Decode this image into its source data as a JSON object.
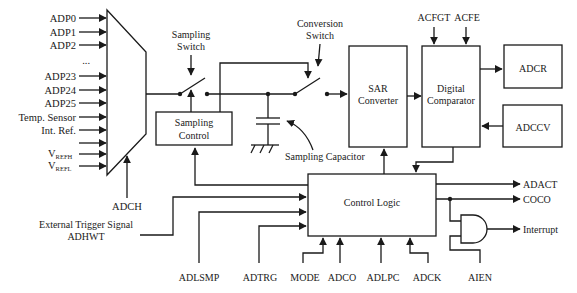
{
  "diagram": {
    "mux": {
      "inputs": [
        "ADP0",
        "ADP1",
        "ADP2",
        "...",
        "ADP23",
        "ADP24",
        "ADP25",
        "Temp. Sensor",
        "Int. Ref.",
        "",
        "V",
        "V"
      ],
      "vrefh_main": "V",
      "vrefh_sub": "REFH",
      "vrefl_main": "V",
      "vrefl_sub": "REFL",
      "select_label": "ADCH"
    },
    "sampling_switch_label_1": "Sampling",
    "sampling_switch_label_2": "Switch",
    "conversion_switch_label_1": "Conversion",
    "conversion_switch_label_2": "Switch",
    "sampling_control_1": "Sampling",
    "sampling_control_2": "Control",
    "sampling_capacitor": "Sampling Capacitor",
    "sar_1": "SAR",
    "sar_2": "Converter",
    "digital_comparator_1": "Digital",
    "digital_comparator_2": "Comparator",
    "acfgt": "ACFGT",
    "acfe": "ACFE",
    "adcr": "ADCR",
    "adccv": "ADCCV",
    "control_logic": "Control Logic",
    "ext_trigger_1": "External Trigger Signal",
    "ext_trigger_2": "ADHWT",
    "bottom_inputs": [
      "ADLSMP",
      "ADTRG",
      "MODE",
      "ADCO",
      "ADLPC",
      "ADCK",
      "AIEN"
    ],
    "outputs": [
      "ADACT",
      "COCO",
      "Interrupt"
    ]
  }
}
